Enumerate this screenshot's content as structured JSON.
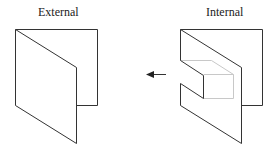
{
  "diagram": {
    "left": {
      "label": "External"
    },
    "right": {
      "label": "Internal"
    },
    "arrow": {
      "direction": "left",
      "from": "Internal",
      "to": "External"
    },
    "colors": {
      "line": "#333333",
      "hidden_line": "#c8c8c8",
      "background": "#ffffff"
    }
  }
}
